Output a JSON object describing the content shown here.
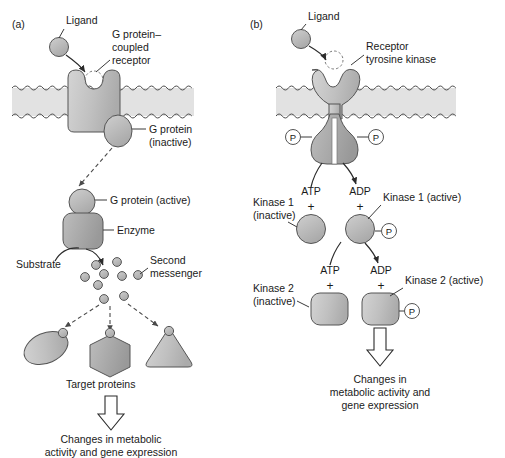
{
  "figure": {
    "background_color": "#ffffff",
    "shape_fill_light": "#d0d0d0",
    "shape_fill_mid": "#bdbdbd",
    "shape_fill_dark": "#a8a8a8",
    "membrane_color": "#e2e2e2",
    "outline_color": "#555555",
    "text_color": "#1a1a1a"
  },
  "panel_a": {
    "letter": "(a)",
    "labels": {
      "ligand": "Ligand",
      "receptor_line1": "G protein–",
      "receptor_line2": "coupled",
      "receptor_line3": "receptor",
      "g_protein_inactive_line1": "G protein",
      "g_protein_inactive_line2": "(inactive)",
      "g_protein_active": "G protein (active)",
      "enzyme": "Enzyme",
      "substrate": "Substrate",
      "second_messenger_line1": "Second",
      "second_messenger_line2": "messenger",
      "target_proteins": "Target proteins",
      "outcome_line1": "Changes in metabolic",
      "outcome_line2": "activity and gene expression"
    },
    "second_messenger_dot_count": 9,
    "target_protein_shapes": [
      "ellipse",
      "hexagon",
      "triangle"
    ]
  },
  "panel_b": {
    "letter": "(b)",
    "labels": {
      "ligand": "Ligand",
      "receptor_line1": "Receptor",
      "receptor_line2": "tyrosine kinase",
      "phosphate_glyph": "P",
      "atp_1": "ATP",
      "adp_1": "ADP",
      "plus_1_left": "+",
      "plus_1_right": "+",
      "kinase1_inactive_line1": "Kinase 1",
      "kinase1_inactive_line2": "(inactive)",
      "kinase1_active": "Kinase 1 (active)",
      "atp_2": "ATP",
      "adp_2": "ADP",
      "plus_2_left": "+",
      "plus_2_right": "+",
      "kinase2_inactive_line1": "Kinase 2",
      "kinase2_inactive_line2": "(inactive)",
      "kinase2_active": "Kinase 2 (active)",
      "outcome_line1": "Changes in",
      "outcome_line2": "metabolic activity and",
      "outcome_line3": "gene expression"
    }
  }
}
